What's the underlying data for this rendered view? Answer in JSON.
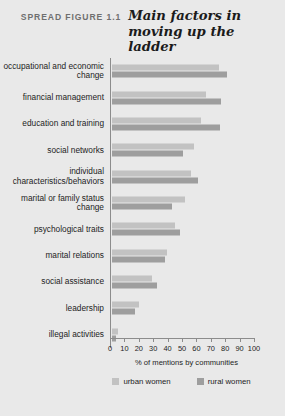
{
  "figure": {
    "kicker": "SPREAD FIGURE 1.1",
    "title": "Main factors in moving up the ladder"
  },
  "colors": {
    "urban": "#c2c2c2",
    "rural": "#9e9e9e",
    "background": "#e9e9e9",
    "axis": "#8c8c8c",
    "text": "#1d1d1d",
    "kicker": "#6f6f6f"
  },
  "chart_data": {
    "type": "bar",
    "orientation": "horizontal",
    "title": "Main factors in moving up the ladder",
    "xlabel": "% of mentions by communities",
    "ylabel": "",
    "xlim": [
      0,
      100
    ],
    "xticks": [
      0,
      10,
      20,
      30,
      40,
      50,
      60,
      70,
      80,
      90,
      100
    ],
    "grid": false,
    "legend_position": "bottom",
    "categories": [
      "occupational and economic change",
      "financial management",
      "education and training",
      "social networks",
      "individual characteristics/behaviors",
      "marital or family status change",
      "psychological traits",
      "marital relations",
      "social assistance",
      "leadership",
      "illegal activities"
    ],
    "series": [
      {
        "name": "urban women",
        "color": "#c2c2c2",
        "values": [
          74,
          65,
          62,
          57,
          55,
          51,
          44,
          38,
          28,
          19,
          4
        ]
      },
      {
        "name": "rural women",
        "color": "#9e9e9e",
        "values": [
          80,
          76,
          75,
          49,
          60,
          42,
          47,
          37,
          31,
          16,
          3
        ]
      }
    ]
  },
  "axis": {
    "tick_labels": [
      "0",
      "10",
      "20",
      "30",
      "40",
      "50",
      "60",
      "70",
      "80",
      "90",
      "100"
    ],
    "title": "% of mentions by communities"
  },
  "legend": {
    "items": [
      {
        "label": "urban women",
        "key": "urban"
      },
      {
        "label": "rural women",
        "key": "rural"
      }
    ]
  }
}
